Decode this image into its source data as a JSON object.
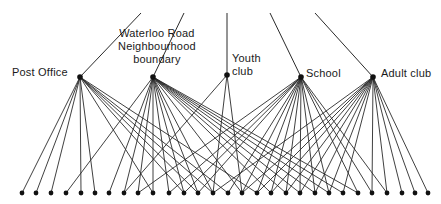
{
  "diagram": {
    "type": "bipartite-network",
    "line_color": "#2a2a2a",
    "dot_color": "#111111",
    "hubs": [
      {
        "id": "post_office",
        "label": "Post Office",
        "x": 80,
        "y": 77,
        "top": [
          141,
          13
        ],
        "label_pos": {
          "left": 12,
          "top": 66
        },
        "targets": [
          0,
          1,
          2,
          4,
          5,
          9,
          11,
          12,
          13,
          14,
          16
        ]
      },
      {
        "id": "waterloo",
        "label_lines": [
          "Waterloo Road",
          "Neighbourhood",
          "boundary"
        ],
        "x": 153,
        "y": 77,
        "top": [
          184,
          13
        ],
        "label_pos": {
          "left": 120,
          "top": 29
        },
        "targets": [
          3,
          6,
          7,
          8,
          9,
          10,
          11,
          12,
          13,
          15,
          17,
          18,
          19,
          20,
          21,
          22,
          23
        ]
      },
      {
        "id": "youth_club",
        "label_lines": [
          "Youth",
          "club"
        ],
        "x": 227,
        "y": 75,
        "top": [
          227,
          13
        ],
        "label_pos": {
          "left": 232,
          "top": 52
        },
        "targets": [
          7,
          13,
          15
        ]
      },
      {
        "id": "school",
        "label": "School",
        "x": 301,
        "y": 77,
        "top": [
          270,
          13
        ],
        "label_pos": {
          "left": 306,
          "top": 67
        },
        "targets": [
          8,
          10,
          11,
          12,
          14,
          15,
          16,
          17,
          18,
          19,
          20,
          21,
          23,
          24,
          25
        ]
      },
      {
        "id": "adult_club",
        "label": "Adult club",
        "x": 373,
        "y": 77,
        "top": [
          315,
          13
        ],
        "label_pos": {
          "left": 381,
          "top": 67
        },
        "targets": [
          13,
          15,
          16,
          17,
          18,
          19,
          20,
          21,
          22,
          24,
          25,
          26,
          27,
          28,
          29
        ]
      }
    ],
    "bottom_nodes": {
      "y": 193,
      "x": [
        22,
        36,
        51,
        66,
        81,
        95,
        109,
        124,
        138,
        153,
        169,
        184,
        198,
        213,
        228,
        242,
        257,
        271,
        286,
        300,
        315,
        329,
        343,
        358,
        372,
        387,
        402,
        415,
        428,
        428
      ]
    }
  },
  "labels": {
    "post_office": "Post Office",
    "waterloo_1": "Waterloo Road",
    "waterloo_2": "Neighbourhood",
    "waterloo_3": "boundary",
    "youth_1": "Youth",
    "youth_2": "club",
    "school": "School",
    "adult_club": "Adult club"
  }
}
